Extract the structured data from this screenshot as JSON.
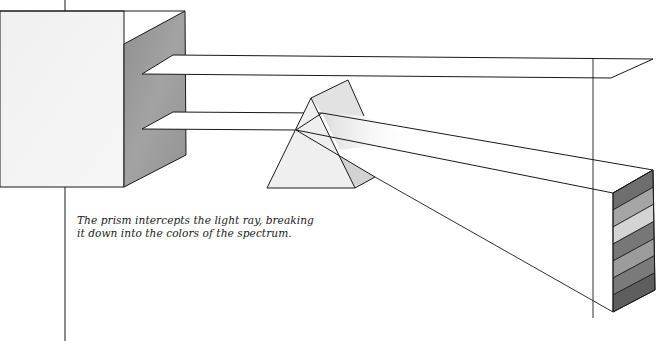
{
  "figure": {
    "elements": {
      "light_source": "box-with-two-slits",
      "beams": [
        "upper-beam",
        "lower-beam"
      ],
      "prism": "triangular-prism",
      "spectrum_bands": 7
    },
    "colors": {
      "line": "#1a1a1a",
      "box_front": "#f2f2f2",
      "box_side": "#9a9a9a",
      "prism_face": "#ececec",
      "prism_shadow": "#d6d6d6",
      "beam_glow": "#e6e6e6",
      "spectrum_bands": [
        "#6e6e6e",
        "#a5a5a5",
        "#d4d4d4",
        "#777777",
        "#9c9c9c",
        "#7a7a7a",
        "#5e5e5e"
      ]
    }
  },
  "caption": {
    "line1": "The prism intercepts the light ray, breaking",
    "line2": "it down into the colors of the spectrum."
  }
}
